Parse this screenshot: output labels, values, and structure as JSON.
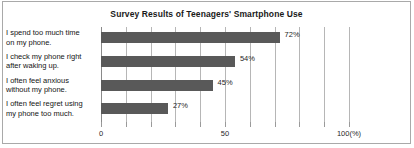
{
  "chart_data": {
    "type": "bar",
    "orientation": "horizontal",
    "title": "Survey Results of Teenagers' Smartphone Use",
    "categories": [
      "I spend too much time\non my phone.",
      "I check my phone right\nafter waking up.",
      "I often feel anxious\nwithout my phone.",
      "I often feel regret using\nmy phone too much."
    ],
    "values": [
      72,
      54,
      45,
      27
    ],
    "value_labels": [
      "72%",
      "54%",
      "45%",
      "27%"
    ],
    "xlabel": "",
    "ylabel": "",
    "xlim": [
      0,
      100
    ],
    "xticks": [
      0,
      10,
      20,
      30,
      40,
      50,
      60,
      70,
      80,
      90,
      100
    ],
    "xtick_labels": [
      {
        "value": 0,
        "text": "0"
      },
      {
        "value": 50,
        "text": "50"
      },
      {
        "value": 100,
        "text": "100(%)"
      }
    ],
    "grid": true,
    "legend": false,
    "bar_color": "#595959",
    "grid_color": "#b6b6b6",
    "axis_color": "#8a8a8a",
    "border_color": "#a9a9a9",
    "background_color": "#ffffff",
    "text_color": "#1a1a1a"
  }
}
